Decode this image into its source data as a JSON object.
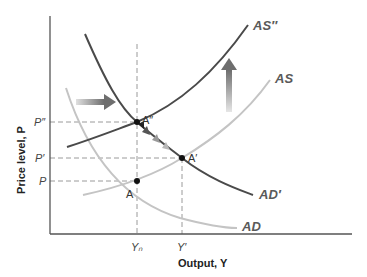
{
  "diagram": {
    "type": "AS-AD model",
    "axes": {
      "y_title": "Price level, P",
      "x_title": "Output, Y",
      "y_ticks": [
        "P″",
        "P′",
        "P"
      ],
      "x_ticks": [
        "Yₙ",
        "Y′"
      ]
    },
    "curves": {
      "as_double_prime": "AS″",
      "as": "AS",
      "ad_prime": "AD′",
      "ad": "AD"
    },
    "points": {
      "a_double_prime": "A″",
      "a_prime": "A′",
      "a": "A"
    },
    "colors": {
      "dark_curve": "#4a4a4a",
      "light_curve": "#c4c4c4",
      "arrow": "#7a7a7a",
      "dashed": "#999999",
      "axis": "#555555",
      "point": "#111111"
    }
  }
}
